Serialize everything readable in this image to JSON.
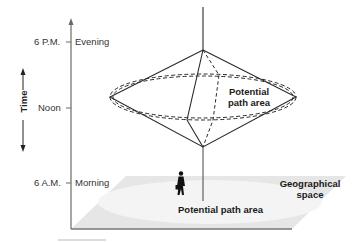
{
  "diagram": {
    "type": "space-time-prism",
    "axis": {
      "label": "Time",
      "ticks": [
        {
          "time": "6 P.M.",
          "period": "Evening"
        },
        {
          "time": "Noon",
          "period": ""
        },
        {
          "time": "6 A.M.",
          "period": "Morning"
        }
      ]
    },
    "prism_label_line1": "Potential",
    "prism_label_line2": "path area",
    "ground_label": "Potential path area",
    "plane_label_line1": "Geographical",
    "plane_label_line2": "space",
    "colors": {
      "line": "#2a2a2a",
      "axis": "#555555",
      "plane": "#e4e4e4",
      "plane_inner": "#f2f2f2",
      "text": "#333333"
    }
  }
}
